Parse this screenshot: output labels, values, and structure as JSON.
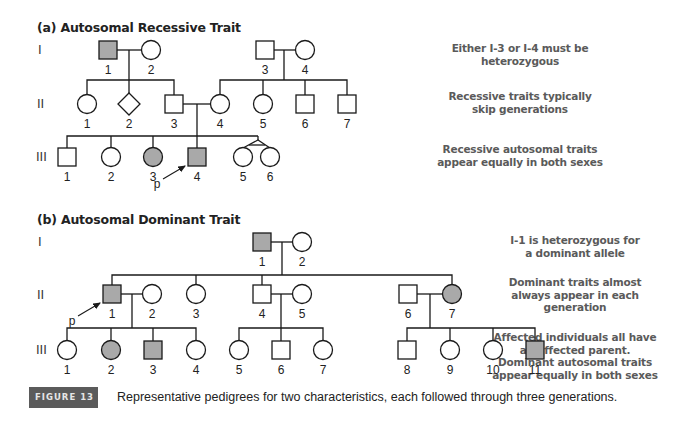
{
  "colors": {
    "line": "#1a1a1a",
    "affected_fill": "#a9a9a9",
    "unaffected_fill": "#ffffff",
    "note_text": "#5a5a5a",
    "figure_badge_bg": "#5b5b5b"
  },
  "panel_a": {
    "title": "(a) Autosomal Recessive Trait",
    "generation_labels": [
      "I",
      "II",
      "III"
    ],
    "notes": [
      [
        "Either I-3 or I-4 must be",
        "heterozygous"
      ],
      [
        "Recessive traits typically",
        "skip generations"
      ],
      [
        "Recessive autosomal traits",
        "appear equally in both sexes"
      ]
    ],
    "proband_label": "p",
    "individuals": [
      {
        "id": "I-1",
        "gen": "I",
        "num": "1",
        "sex": "male",
        "affected": true
      },
      {
        "id": "I-2",
        "gen": "I",
        "num": "2",
        "sex": "female",
        "affected": false
      },
      {
        "id": "I-3",
        "gen": "I",
        "num": "3",
        "sex": "male",
        "affected": false
      },
      {
        "id": "I-4",
        "gen": "I",
        "num": "4",
        "sex": "female",
        "affected": false
      },
      {
        "id": "II-1",
        "gen": "II",
        "num": "1",
        "sex": "female",
        "affected": false
      },
      {
        "id": "II-2",
        "gen": "II",
        "num": "2",
        "sex": "unknown",
        "affected": false
      },
      {
        "id": "II-3",
        "gen": "II",
        "num": "3",
        "sex": "male",
        "affected": false
      },
      {
        "id": "II-4",
        "gen": "II",
        "num": "4",
        "sex": "female",
        "affected": false
      },
      {
        "id": "II-5",
        "gen": "II",
        "num": "5",
        "sex": "female",
        "affected": false
      },
      {
        "id": "II-6",
        "gen": "II",
        "num": "6",
        "sex": "male",
        "affected": false
      },
      {
        "id": "II-7",
        "gen": "II",
        "num": "7",
        "sex": "male",
        "affected": false
      },
      {
        "id": "III-1",
        "gen": "III",
        "num": "1",
        "sex": "male",
        "affected": false
      },
      {
        "id": "III-2",
        "gen": "III",
        "num": "2",
        "sex": "female",
        "affected": false
      },
      {
        "id": "III-3",
        "gen": "III",
        "num": "3",
        "sex": "female",
        "affected": true
      },
      {
        "id": "III-4",
        "gen": "III",
        "num": "4",
        "sex": "male",
        "affected": true,
        "proband": true
      },
      {
        "id": "III-5",
        "gen": "III",
        "num": "5",
        "sex": "female",
        "affected": false,
        "twin": "identical"
      },
      {
        "id": "III-6",
        "gen": "III",
        "num": "6",
        "sex": "female",
        "affected": false,
        "twin": "identical"
      }
    ]
  },
  "panel_b": {
    "title": "(b) Autosomal Dominant Trait",
    "generation_labels": [
      "I",
      "II",
      "III"
    ],
    "notes": [
      [
        "I-1 is heterozygous for",
        "a dominant allele"
      ],
      [
        "Dominant traits almost",
        "always appear in each",
        "generation"
      ],
      [
        "Affected individuals all have",
        "an affected parent.",
        "Dominant autosomal traits",
        "appear equally in both sexes"
      ]
    ],
    "proband_label": "p",
    "individuals": [
      {
        "id": "I-1",
        "gen": "I",
        "num": "1",
        "sex": "male",
        "affected": true
      },
      {
        "id": "I-2",
        "gen": "I",
        "num": "2",
        "sex": "female",
        "affected": false
      },
      {
        "id": "II-1",
        "gen": "II",
        "num": "1",
        "sex": "male",
        "affected": true,
        "proband": true
      },
      {
        "id": "II-2",
        "gen": "II",
        "num": "2",
        "sex": "female",
        "affected": false
      },
      {
        "id": "II-3",
        "gen": "II",
        "num": "3",
        "sex": "female",
        "affected": false
      },
      {
        "id": "II-4",
        "gen": "II",
        "num": "4",
        "sex": "male",
        "affected": false
      },
      {
        "id": "II-5",
        "gen": "II",
        "num": "5",
        "sex": "female",
        "affected": false
      },
      {
        "id": "II-6",
        "gen": "II",
        "num": "6",
        "sex": "male",
        "affected": false
      },
      {
        "id": "II-7",
        "gen": "II",
        "num": "7",
        "sex": "female",
        "affected": true
      },
      {
        "id": "III-1",
        "gen": "III",
        "num": "1",
        "sex": "female",
        "affected": false
      },
      {
        "id": "III-2",
        "gen": "III",
        "num": "2",
        "sex": "female",
        "affected": true
      },
      {
        "id": "III-3",
        "gen": "III",
        "num": "3",
        "sex": "male",
        "affected": true
      },
      {
        "id": "III-4",
        "gen": "III",
        "num": "4",
        "sex": "female",
        "affected": false
      },
      {
        "id": "III-5",
        "gen": "III",
        "num": "5",
        "sex": "female",
        "affected": false
      },
      {
        "id": "III-6",
        "gen": "III",
        "num": "6",
        "sex": "male",
        "affected": false
      },
      {
        "id": "III-7",
        "gen": "III",
        "num": "7",
        "sex": "female",
        "affected": false
      },
      {
        "id": "III-8",
        "gen": "III",
        "num": "8",
        "sex": "male",
        "affected": false
      },
      {
        "id": "III-9",
        "gen": "III",
        "num": "9",
        "sex": "female",
        "affected": false
      },
      {
        "id": "III-10",
        "gen": "III",
        "num": "10",
        "sex": "female",
        "affected": false
      },
      {
        "id": "III-11",
        "gen": "III",
        "num": "11",
        "sex": "male",
        "affected": true
      }
    ]
  },
  "figure": {
    "label": "FIGURE 13",
    "caption": "Representative pedigrees for two characteristics, each followed through three generations."
  }
}
